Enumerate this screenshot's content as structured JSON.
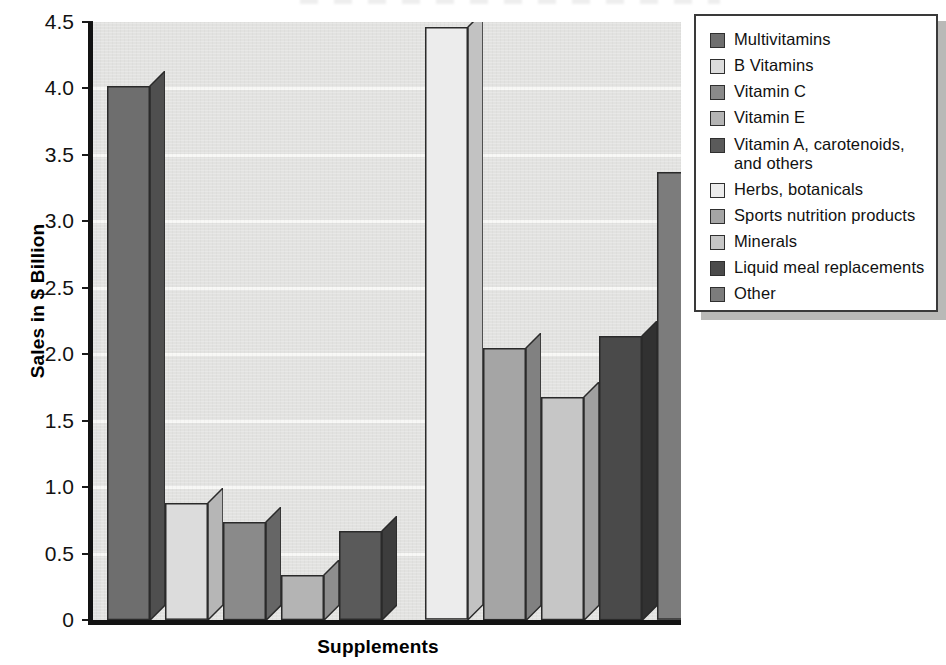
{
  "chart_data": {
    "type": "bar",
    "title": "",
    "xlabel": "Supplements",
    "ylabel": "Sales in $ Billion",
    "ylim": [
      0,
      4.5
    ],
    "ytick_labels": [
      "4.5",
      "4.0",
      "3.5",
      "3.0",
      "2.5",
      "2.0",
      "1.5",
      "1.0",
      "0.5",
      "0"
    ],
    "ytick_values": [
      4.5,
      4.0,
      3.5,
      3.0,
      2.5,
      2.0,
      1.5,
      1.0,
      0.5,
      0
    ],
    "grid": "horizontal",
    "legend_position": "right",
    "categories": [
      "Multivitamins",
      "B Vitamins",
      "Vitamin C",
      "Vitamin E",
      "Vitamin A, carotenoids, and others",
      "Herbs, botanicals",
      "Sports nutrition products",
      "Minerals",
      "Liquid meal replacements",
      "Other"
    ],
    "values": [
      4.02,
      0.88,
      0.74,
      0.34,
      0.67,
      4.46,
      2.05,
      1.68,
      2.14,
      3.37
    ],
    "colors": [
      "#6e6e6e",
      "#dcdcdc",
      "#8a8a8a",
      "#b4b4b4",
      "#5a5a5a",
      "#ececec",
      "#a5a5a5",
      "#c6c6c6",
      "#4a4a4a",
      "#7c7c7c"
    ],
    "side_colors": [
      "#4f4f4f",
      "#b6b6b6",
      "#666666",
      "#8d8d8d",
      "#3d3d3d",
      "#c2c2c2",
      "#818181",
      "#a0a0a0",
      "#313131",
      "#5a5a5a"
    ]
  },
  "legend": {
    "items": [
      {
        "label": "Multivitamins"
      },
      {
        "label": "B Vitamins"
      },
      {
        "label": "Vitamin C"
      },
      {
        "label": "Vitamin E"
      },
      {
        "label": "Vitamin A, carotenoids, and others"
      },
      {
        "label": "Herbs, botanicals"
      },
      {
        "label": "Sports nutrition products"
      },
      {
        "label": "Minerals"
      },
      {
        "label": "Liquid meal replacements"
      },
      {
        "label": "Other"
      }
    ]
  },
  "axes": {
    "y_title": "Sales in $ Billion",
    "x_title": "Supplements"
  }
}
